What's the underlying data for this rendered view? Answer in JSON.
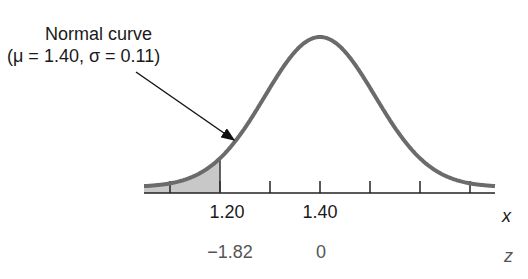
{
  "chart_data": {
    "type": "area",
    "title": "Normal curve",
    "subtitle": "(μ = 1.40, σ = 0.11)",
    "mu": 1.4,
    "sigma": 0.11,
    "shaded_region": {
      "from": "-inf",
      "to": 1.2,
      "z_to": -1.82
    },
    "x_axis": {
      "label": "x",
      "ticks": [
        1.1,
        1.2,
        1.3,
        1.4,
        1.5,
        1.6,
        1.7
      ],
      "labeled_ticks": [
        "1.20",
        "1.40"
      ]
    },
    "z_axis": {
      "label": "z",
      "labeled_ticks": [
        "−1.82",
        "0"
      ]
    },
    "annotation": "Arrow from label 'Normal curve' pointing to the curve near x = 1.20",
    "colors": {
      "curve": "#6b6b6b",
      "shade": "#c8c8c8",
      "axis": "#222222"
    }
  },
  "labels": {
    "title_line1": "Normal curve",
    "title_line2": "(μ = 1.40, σ = 0.11)",
    "x_120": "1.20",
    "x_140": "1.40",
    "x_axis_name": "x",
    "z_m182": "−1.82",
    "z_0": "0",
    "z_axis_name": "z"
  }
}
